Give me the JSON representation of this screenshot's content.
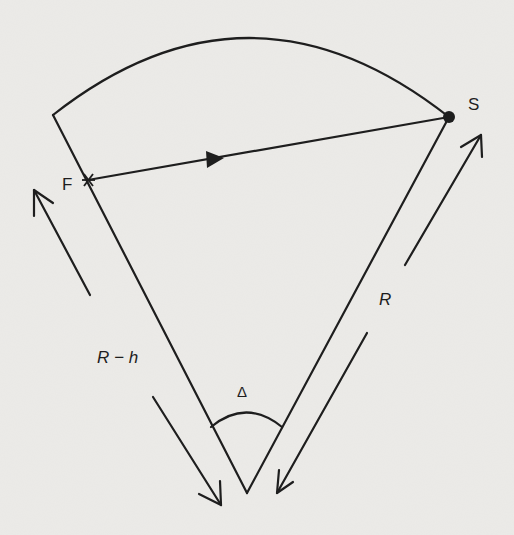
{
  "diagram": {
    "labels": {
      "source_point": "F",
      "receiver_point": "S",
      "radius": "R",
      "inner_radius": "R − h",
      "angle": "Δ"
    },
    "colors": {
      "background": "#ecebe8",
      "stroke": "#1e1e1e"
    }
  }
}
